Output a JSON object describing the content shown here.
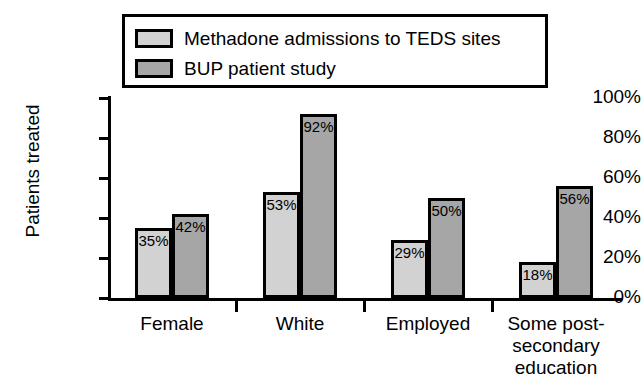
{
  "chart_data": {
    "type": "bar",
    "title": "",
    "xlabel": "",
    "ylabel": "Patients treated",
    "ylim": [
      0,
      100
    ],
    "y_unit": "%",
    "grid": false,
    "legend_position": "top",
    "categories": [
      "Female",
      "White",
      "Employed",
      "Some post-secondary education"
    ],
    "category_lines": [
      [
        "Female"
      ],
      [
        "White"
      ],
      [
        "Employed"
      ],
      [
        "Some post-",
        "secondary",
        "education"
      ]
    ],
    "y_ticks": [
      "0%",
      "20%",
      "40%",
      "60%",
      "80%",
      "100%"
    ],
    "y_tick_values": [
      0,
      20,
      40,
      60,
      80,
      100
    ],
    "series": [
      {
        "name": "Methadone admissions to TEDS sites",
        "color": "#d2d2d2",
        "values": [
          35,
          53,
          29,
          18
        ],
        "labels": [
          "35%",
          "53%",
          "29%",
          "18%"
        ]
      },
      {
        "name": "BUP patient study",
        "color": "#a6a6a6",
        "values": [
          42,
          92,
          50,
          56
        ],
        "labels": [
          "42%",
          "92%",
          "50%",
          "56%"
        ]
      }
    ]
  },
  "legend": {
    "items": [
      {
        "label": "Methadone admissions to TEDS sites",
        "swatch": "series-a"
      },
      {
        "label": "BUP patient study",
        "swatch": "series-b"
      }
    ]
  },
  "colors": {
    "series_a": "#d2d2d2",
    "series_b": "#a6a6a6",
    "axis": "#000000",
    "background": "#ffffff"
  }
}
